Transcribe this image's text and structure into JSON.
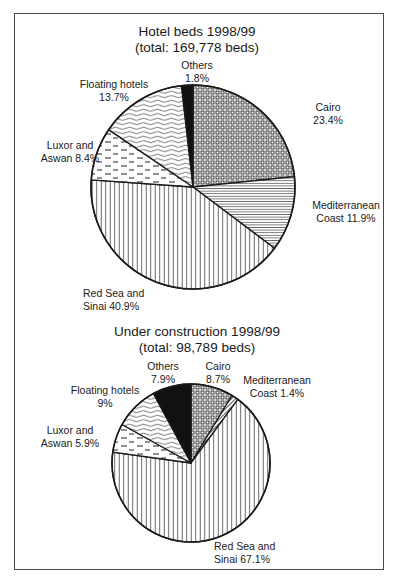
{
  "chart_data": [
    {
      "type": "pie",
      "title": "Hotel beds 1998/99",
      "subtitle": "(total: 169,778 beds)",
      "total": 169778,
      "unit": "beds",
      "start_angle_deg": 0,
      "direction": "clockwise",
      "slices": [
        {
          "name": "Cairo",
          "value": 23.4,
          "label_lines": [
            "Cairo",
            "23.4%"
          ],
          "pattern": "grid-dots"
        },
        {
          "name": "Mediterranean Coast",
          "value": 11.9,
          "label_lines": [
            "Mediterranean",
            "Coast 11.9%"
          ],
          "pattern": "horizontal-lines"
        },
        {
          "name": "Red Sea and Sinai",
          "value": 40.9,
          "label_lines": [
            "Red Sea and",
            "Sinai 40.9%"
          ],
          "pattern": "vertical-lines"
        },
        {
          "name": "Luxor and Aswan",
          "value": 8.4,
          "label_lines": [
            "Luxor and",
            "Aswan 8.4%"
          ],
          "pattern": "dashes"
        },
        {
          "name": "Floating hotels",
          "value": 13.7,
          "label_lines": [
            "Floating hotels",
            "13.7%"
          ],
          "pattern": "waves"
        },
        {
          "name": "Others",
          "value": 1.8,
          "label_lines": [
            "Others",
            "1.8%"
          ],
          "pattern": "solid-black"
        }
      ]
    },
    {
      "type": "pie",
      "title": "Under construction 1998/99",
      "subtitle": "(total: 98,789 beds)",
      "total": 98789,
      "unit": "beds",
      "start_angle_deg": 0,
      "direction": "clockwise",
      "slices": [
        {
          "name": "Cairo",
          "value": 8.7,
          "label_lines": [
            "Cairo",
            "8.7%"
          ],
          "pattern": "grid-dots"
        },
        {
          "name": "Mediterranean Coast",
          "value": 1.4,
          "label_lines": [
            "Mediterranean",
            "Coast 1.4%"
          ],
          "pattern": "diagonal-lines"
        },
        {
          "name": "Red Sea and Sinai",
          "value": 67.1,
          "label_lines": [
            "Red Sea and",
            "Sinai 67.1%"
          ],
          "pattern": "vertical-lines"
        },
        {
          "name": "Luxor and Aswan",
          "value": 5.9,
          "label_lines": [
            "Luxor and",
            "Aswan 5.9%"
          ],
          "pattern": "dashes"
        },
        {
          "name": "Floating hotels",
          "value": 9,
          "label_lines": [
            "Floating hotels",
            "9%"
          ],
          "pattern": "waves"
        },
        {
          "name": "Others",
          "value": 7.9,
          "label_lines": [
            "Others",
            "7.9%"
          ],
          "pattern": "solid-black"
        }
      ]
    }
  ],
  "layout": {
    "pies": [
      {
        "cx": 193,
        "cy": 187,
        "r": 102,
        "title_y": [
          36,
          52
        ],
        "labels": [
          {
            "x": 328,
            "y": 111,
            "anchor": "middle"
          },
          {
            "x": 346,
            "y": 209,
            "anchor": "middle"
          },
          {
            "x": 83,
            "y": 297,
            "anchor": "start"
          },
          {
            "x": 70,
            "y": 149,
            "anchor": "middle"
          },
          {
            "x": 114,
            "y": 88,
            "anchor": "middle"
          },
          {
            "x": 197,
            "y": 69,
            "anchor": "middle"
          }
        ]
      },
      {
        "cx": 191,
        "cy": 463,
        "r": 79,
        "title_y": [
          336,
          352
        ],
        "labels": [
          {
            "x": 218,
            "y": 370,
            "anchor": "middle"
          },
          {
            "x": 277,
            "y": 384,
            "anchor": "middle"
          },
          {
            "x": 214,
            "y": 550,
            "anchor": "start"
          },
          {
            "x": 70,
            "y": 434,
            "anchor": "middle"
          },
          {
            "x": 105,
            "y": 394,
            "anchor": "middle"
          },
          {
            "x": 163,
            "y": 370,
            "anchor": "middle"
          }
        ]
      }
    ],
    "colors": {
      "stroke": "#1a1a1a",
      "fill": "#ffffff",
      "black": "#111111",
      "frame": "#4a4a4a"
    }
  }
}
